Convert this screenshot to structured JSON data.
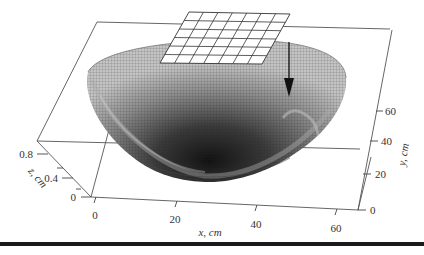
{
  "figure": {
    "type": "3d-surface",
    "axes": {
      "x": {
        "label": "x, cm",
        "ticks": [
          "0",
          "20",
          "40",
          "60"
        ]
      },
      "y": {
        "label": "y, cm",
        "ticks": [
          "0",
          "20",
          "40",
          "60"
        ]
      },
      "z": {
        "label": "z, cm",
        "ticks": [
          "0",
          "0.4",
          "0.8"
        ]
      }
    },
    "annotations": {
      "grid_patch": {
        "rows": 6,
        "cols": 7
      },
      "arrow": "downward arrow pointing into surface"
    },
    "colors": {
      "surface_light": "#bdbdbd",
      "surface_dark": "#1e1e1e",
      "mesh": "#2a2a2a",
      "box": "#555555",
      "rule": "#1a1a1a"
    }
  }
}
